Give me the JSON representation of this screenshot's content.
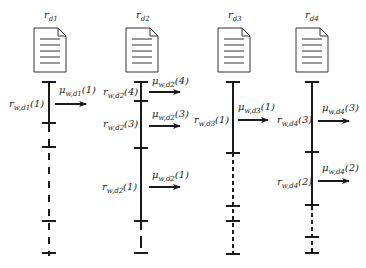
{
  "diagram": {
    "type": "per-document timeline diagram",
    "columns": [
      {
        "id": "d1",
        "title": "r",
        "title_sub": "d1",
        "rates": [
          {
            "r_label": "r",
            "r_sub": "w,d1",
            "r_idx": "(1)",
            "mu_label": "μ",
            "mu_sub": "w,d1",
            "mu_idx": "(1)"
          }
        ]
      },
      {
        "id": "d2",
        "title": "r",
        "title_sub": "d2",
        "rates": [
          {
            "r_label": "r",
            "r_sub": "w,d2",
            "r_idx": "(4)",
            "mu_label": "μ",
            "mu_sub": "w,d2",
            "mu_idx": "(4)"
          },
          {
            "r_label": "r",
            "r_sub": "w,d2",
            "r_idx": "(3)",
            "mu_label": "μ",
            "mu_sub": "w,d2",
            "mu_idx": "(3)"
          },
          {
            "r_label": "r",
            "r_sub": "w,d2",
            "r_idx": "(1)",
            "mu_label": "μ",
            "mu_sub": "w,d2",
            "mu_idx": "(1)"
          }
        ]
      },
      {
        "id": "d3",
        "title": "r",
        "title_sub": "d3",
        "rates": [
          {
            "r_label": "r",
            "r_sub": "w,d3",
            "r_idx": "(1)",
            "mu_label": "μ",
            "mu_sub": "w,d3",
            "mu_idx": "(1)"
          }
        ]
      },
      {
        "id": "d4",
        "title": "r",
        "title_sub": "d4",
        "rates": [
          {
            "r_label": "r",
            "r_sub": "w,d4",
            "r_idx": "(3)",
            "mu_label": "μ",
            "mu_sub": "w,d4",
            "mu_idx": "(3)"
          },
          {
            "r_label": "r",
            "r_sub": "w,d4",
            "r_idx": "(2)",
            "mu_label": "μ",
            "mu_sub": "w,d4",
            "mu_idx": "(2)"
          }
        ]
      }
    ]
  }
}
